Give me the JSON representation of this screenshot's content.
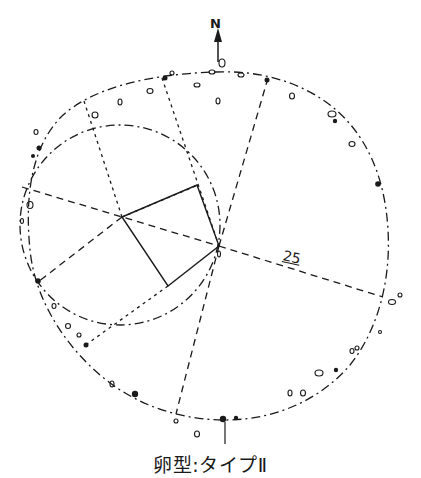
{
  "figure": {
    "caption": "卵型:タイプⅡ",
    "north_label": "N",
    "distance_label": "25",
    "colors": {
      "ink": "#1a1a1a",
      "background": "#ffffff"
    },
    "elements": {
      "outer_outline": "dash-dot oval (stone arrangement perimeter)",
      "inner_circle": "dash-dot circle (left)",
      "quadrilateral": "solid four-sided figure at center",
      "radial_lines": "dashed lines from center points to perimeter",
      "stones": "small open and filled stone markers along perimeter"
    }
  }
}
